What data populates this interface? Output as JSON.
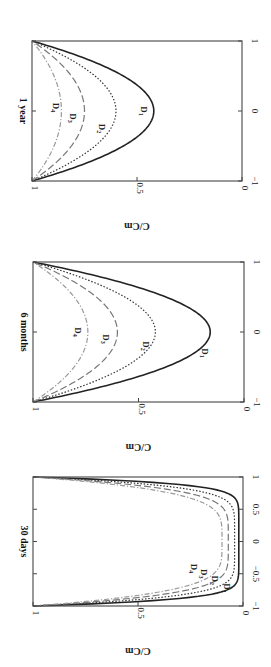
{
  "chart_data": [
    {
      "type": "line",
      "title": "1 year",
      "xlabel": "",
      "ylabel": "C/Cm",
      "x_range": [
        -1,
        1
      ],
      "ylim": [
        0,
        1
      ],
      "x_ticks": [
        "-1",
        "0",
        "1"
      ],
      "y_ticks": [
        "0",
        "0.5",
        "1"
      ],
      "grid": false,
      "rotated": true,
      "series": [
        {
          "name": "D1",
          "style": "solid",
          "color": "#222222",
          "min": 0.42,
          "shape": "parabola"
        },
        {
          "name": "D2",
          "style": "dotted",
          "color": "#333333",
          "min": 0.6,
          "shape": "parabola"
        },
        {
          "name": "D3",
          "style": "dashed",
          "color": "#777777",
          "min": 0.75,
          "shape": "parabola"
        },
        {
          "name": "D4",
          "style": "dashdot",
          "color": "#999999",
          "min": 0.86,
          "shape": "parabola"
        }
      ]
    },
    {
      "type": "line",
      "title": "6 months",
      "xlabel": "",
      "ylabel": "C/Cm",
      "x_range": [
        -1,
        1
      ],
      "ylim": [
        0,
        1
      ],
      "x_ticks": [
        "-1",
        "0",
        "1"
      ],
      "y_ticks": [
        "0",
        "0.5",
        "1"
      ],
      "grid": false,
      "rotated": true,
      "series": [
        {
          "name": "D1",
          "style": "solid",
          "color": "#222222",
          "min": 0.16,
          "shape": "parabola"
        },
        {
          "name": "D2",
          "style": "dotted",
          "color": "#333333",
          "min": 0.42,
          "shape": "parabola"
        },
        {
          "name": "D3",
          "style": "dashed",
          "color": "#777777",
          "min": 0.6,
          "shape": "parabola"
        },
        {
          "name": "D4",
          "style": "dashdot",
          "color": "#999999",
          "min": 0.74,
          "shape": "parabola"
        }
      ]
    },
    {
      "type": "line",
      "title": "30 days",
      "xlabel": "",
      "ylabel": "C/Cm",
      "x_range": [
        -1,
        1
      ],
      "ylim": [
        0,
        1
      ],
      "x_ticks": [
        "-1",
        "-0.5",
        "0",
        "0.5",
        "1"
      ],
      "y_ticks": [
        "0",
        "0.5",
        "1"
      ],
      "grid": false,
      "rotated": true,
      "series": [
        {
          "name": "D1",
          "style": "solid",
          "color": "#222222",
          "min": 0.02,
          "shape": "flat",
          "power": 10
        },
        {
          "name": "D2",
          "style": "dotted",
          "color": "#333333",
          "min": 0.04,
          "shape": "flat",
          "power": 7
        },
        {
          "name": "D3",
          "style": "dashed",
          "color": "#777777",
          "min": 0.07,
          "shape": "flat",
          "power": 5.5
        },
        {
          "name": "D4",
          "style": "dashdot",
          "color": "#999999",
          "min": 0.1,
          "shape": "flat",
          "power": 4.5
        }
      ]
    }
  ],
  "panels": [
    {
      "title": "1 year",
      "ylabel": "C/Cm",
      "frame": {
        "left": 32,
        "top": 41,
        "right": 242,
        "bottom": 181
      },
      "labels": [
        {
          "text": "D1",
          "x": 0,
          "y": 0.48
        },
        {
          "text": "D2",
          "x": -0.25,
          "y": 0.68
        },
        {
          "text": "D3",
          "x": -0.1,
          "y": 0.82
        },
        {
          "text": "D4",
          "x": 0.05,
          "y": 0.9
        }
      ]
    },
    {
      "title": "6 months",
      "ylabel": "C/Cm",
      "frame": {
        "left": 33,
        "top": 262,
        "right": 244,
        "bottom": 402
      },
      "labels": [
        {
          "text": "D1",
          "x": -0.3,
          "y": 0.2
        },
        {
          "text": "D2",
          "x": -0.2,
          "y": 0.48
        },
        {
          "text": "D3",
          "x": -0.1,
          "y": 0.67
        },
        {
          "text": "D4",
          "x": 0.0,
          "y": 0.8
        }
      ]
    },
    {
      "title": "30 days",
      "ylabel": "C/Cm",
      "frame": {
        "left": 33,
        "top": 477,
        "right": 243,
        "bottom": 606
      },
      "labels": [
        {
          "text": "D1",
          "x": -0.72,
          "y": 0.09
        },
        {
          "text": "D2",
          "x": -0.6,
          "y": 0.15
        },
        {
          "text": "D3",
          "x": -0.5,
          "y": 0.2
        },
        {
          "text": "D4",
          "x": -0.42,
          "y": 0.25
        }
      ]
    }
  ]
}
